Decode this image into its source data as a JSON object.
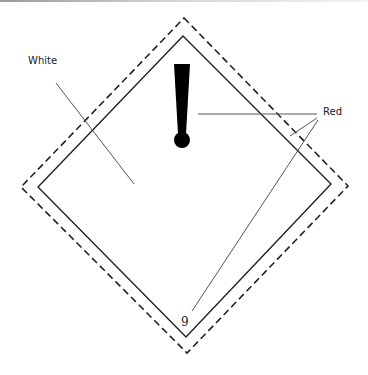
{
  "diagram": {
    "type": "hazard-placard-label-diagram",
    "labels": {
      "white": "White",
      "red": "Red",
      "class_number": "9",
      "symbol": "!"
    },
    "colors": {
      "stroke": "#222222",
      "leader": "#555555",
      "background": "#ffffff"
    },
    "shapes": {
      "outer_border": "dashed",
      "inner_border": "solid"
    }
  }
}
